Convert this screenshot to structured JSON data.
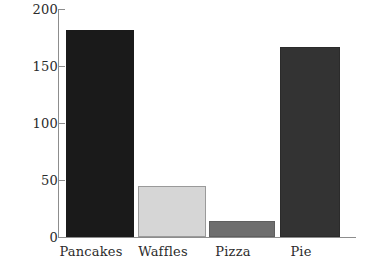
{
  "chart_data": {
    "type": "bar",
    "title": "",
    "xlabel": "",
    "ylabel": "",
    "categories": [
      "Pancakes",
      "Waffles",
      "Pizza",
      "Pie"
    ],
    "values": [
      182,
      45,
      14,
      167
    ],
    "series": [
      {
        "name": "",
        "values": [
          182,
          45,
          14,
          167
        ]
      }
    ],
    "bar_colors": [
      "#1a1a1a",
      "#d6d6d6",
      "#6e6e6e",
      "#333333"
    ],
    "bar_border_colors": [
      "#1a1a1a",
      "#9a9a9a",
      "#5f5f5f",
      "#2b2b2b"
    ],
    "ylim": [
      0,
      200
    ],
    "yticks": [
      0,
      50,
      100,
      150,
      200
    ],
    "ytick_labels": [
      "0",
      "50",
      "100",
      "150",
      "200"
    ],
    "xlim": [
      0,
      4
    ],
    "grid": false,
    "legend": false,
    "legend_position": "none",
    "axis_color": "#8d8d8d",
    "text_color": "#2b2b2b",
    "background_color": "#ffffff"
  }
}
